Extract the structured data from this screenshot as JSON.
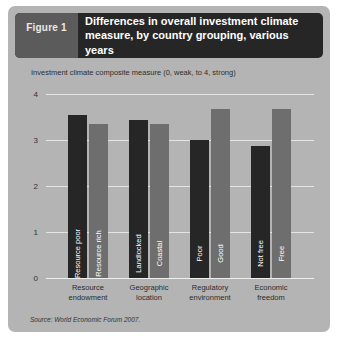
{
  "figure": {
    "tag": "Figure 1",
    "title_line1": "Differences in overall investment climate",
    "title_line2": "measure, by country grouping, various years",
    "source": "Source: World Economic Forum 2007.",
    "colors": {
      "panel_background": "#b4b4b4",
      "header_background": "#262626",
      "tag_background": "#5b5b5b",
      "bar_dark": "#262626",
      "bar_light": "#6e6e6e",
      "gridline": "#e4e4e4"
    }
  },
  "chart_data": {
    "type": "bar",
    "title": "Differences in overall investment climate measure, by country grouping, various years",
    "subtitle": "Investment climate composite measure (0, weak, to 4, strong)",
    "xlabel": "",
    "ylabel": "Investment climate composite measure (0, weak, to 4, strong)",
    "ylim": [
      0,
      4
    ],
    "yticks": [
      "4",
      "3",
      "2",
      "1",
      "0"
    ],
    "ytick_values": [
      4,
      3,
      2,
      1,
      0
    ],
    "grid": true,
    "legend": "none",
    "categories": [
      "Resource endowment",
      "Geographic location",
      "Regulatory environment",
      "Economic freedom"
    ],
    "category_lines": [
      [
        "Resource",
        "endowment"
      ],
      [
        "Geographic",
        "location"
      ],
      [
        "Regulatory",
        "environment"
      ],
      [
        "Economic",
        "freedom"
      ]
    ],
    "bars": [
      {
        "group": "Resource endowment",
        "label": "Resource poor",
        "value": 3.55,
        "shade": "dark"
      },
      {
        "group": "Resource endowment",
        "label": "Resource rich",
        "value": 3.35,
        "shade": "light"
      },
      {
        "group": "Geographic location",
        "label": "Landlocked",
        "value": 3.43,
        "shade": "dark"
      },
      {
        "group": "Geographic location",
        "label": "Coastal",
        "value": 3.35,
        "shade": "light"
      },
      {
        "group": "Regulatory environment",
        "label": "Poor",
        "value": 3.0,
        "shade": "dark"
      },
      {
        "group": "Regulatory environment",
        "label": "Good",
        "value": 3.67,
        "shade": "light"
      },
      {
        "group": "Economic freedom",
        "label": "Not free",
        "value": 2.87,
        "shade": "dark"
      },
      {
        "group": "Economic freedom",
        "label": "Free",
        "value": 3.67,
        "shade": "light"
      }
    ]
  }
}
